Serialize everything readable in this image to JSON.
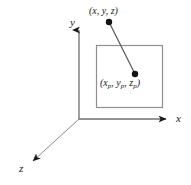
{
  "figure": {
    "type": "3d-axes-projection-diagram",
    "background_color": "#ffffff",
    "stroke_color": "#7a7a7a",
    "text_color": "#1a1a1a",
    "axes": [
      {
        "name": "y-axis",
        "label": "y",
        "direction": "up"
      },
      {
        "name": "x-axis",
        "label": "x",
        "direction": "right"
      },
      {
        "name": "z-axis",
        "label": "z",
        "direction": "down-left"
      }
    ],
    "origin": {
      "x": 79,
      "y": 119
    },
    "projection_plane": {
      "name": "view-plane-rectangle",
      "left": 96,
      "top": 45,
      "width": 67,
      "height": 63
    },
    "points": [
      {
        "name": "world-point",
        "label_prefix": "(",
        "label": "(x, y, z)",
        "coords": {
          "x": 109,
          "y": 22
        }
      },
      {
        "name": "projected-point",
        "label": "(xp, yp, zp)",
        "coords": {
          "x": 135,
          "y": 74
        }
      }
    ],
    "projector_line": {
      "name": "projection-ray",
      "from": {
        "x": 109,
        "y": 22
      },
      "to": {
        "x": 135,
        "y": 74
      }
    }
  },
  "labels": {
    "axis_y": "y",
    "axis_x": "x",
    "axis_z": "z",
    "world_point_open": "(",
    "world_point_x": "x",
    "world_point_comma1": ", ",
    "world_point_y": "y",
    "world_point_comma2": ", ",
    "world_point_z": "z",
    "world_point_close": ")",
    "proj_point_open": "(",
    "proj_point_x": "x",
    "proj_point_xsub": "p",
    "proj_point_comma1": ", ",
    "proj_point_y": "y",
    "proj_point_ysub": "p",
    "proj_point_comma2": ", ",
    "proj_point_z": "z",
    "proj_point_zsub": "p",
    "proj_point_close": ")"
  }
}
